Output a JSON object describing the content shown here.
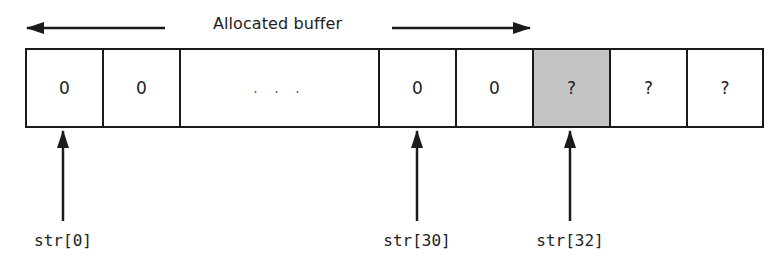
{
  "diagram": {
    "title": "Allocated buffer",
    "cells": [
      {
        "value": "0",
        "shaded": false
      },
      {
        "value": "0",
        "shaded": false
      },
      {
        "value": ". . .",
        "shaded": false
      },
      {
        "value": "0",
        "shaded": false
      },
      {
        "value": "0",
        "shaded": false
      },
      {
        "value": "?",
        "shaded": true
      },
      {
        "value": "?",
        "shaded": false
      },
      {
        "value": "?",
        "shaded": false
      }
    ],
    "pointers": [
      {
        "label": "str[0]",
        "target_cell": 0
      },
      {
        "label": "str[30]",
        "target_cell": 3
      },
      {
        "label": "str[32]",
        "target_cell": 5
      }
    ],
    "colors": {
      "stroke": "#1a1a1a",
      "shaded_fill": "#c3c3c3",
      "background": "#ffffff"
    }
  }
}
